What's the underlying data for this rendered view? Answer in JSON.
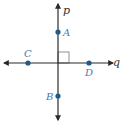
{
  "colors": {
    "line": "#2a2a2a",
    "point": "#1f5a8c",
    "point_label": "#4a7ab0",
    "line_label": "#333333",
    "right_angle": "#777777"
  },
  "lines": {
    "p": {
      "label": "p",
      "x1": 58,
      "y1": 120,
      "x2": 58,
      "y2": 4,
      "label_x": 63,
      "label_y": 14
    },
    "q": {
      "label": "q",
      "x1": 4,
      "y1": 63,
      "x2": 113,
      "y2": 63,
      "label_x": 113,
      "label_y": 66
    }
  },
  "points": [
    {
      "label": "A",
      "cx": 58,
      "cy": 32,
      "label_x": 63,
      "label_y": 36
    },
    {
      "label": "B",
      "cx": 58,
      "cy": 96,
      "label_x": 46,
      "label_y": 100
    },
    {
      "label": "C",
      "cx": 28,
      "cy": 63,
      "label_x": 24,
      "label_y": 57
    },
    {
      "label": "D",
      "cx": 89,
      "cy": 63,
      "label_x": 85,
      "label_y": 76
    }
  ],
  "right_angle_marker": {
    "x": 58,
    "y": 52,
    "size": 11
  }
}
